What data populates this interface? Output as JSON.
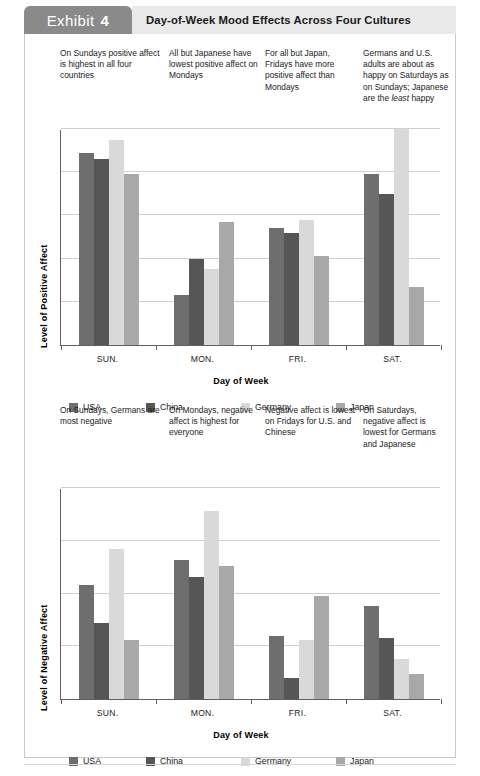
{
  "header": {
    "exhibit_word": "Exhibit",
    "exhibit_number": "4",
    "title": "Day-of-Week Mood Effects Across Four Cultures"
  },
  "palette": {
    "usa": "#6e6e6e",
    "china": "#565656",
    "germany": "#d9d9d9",
    "japan": "#a8a8a8",
    "tab_bg": "#8a8a8a",
    "title_bg": "#e9e9e9",
    "axis": "#5f5f5f",
    "gridline": "#cfcfcf",
    "frame": "#c9c9c9"
  },
  "chart_data": [
    {
      "id": "positive-affect",
      "type": "bar",
      "title": "",
      "xlabel": "Day of Week",
      "ylabel": "Level of Positive Affect",
      "categories": [
        "SUN.",
        "MON.",
        "FRI.",
        "SAT."
      ],
      "ylim": [
        0,
        100
      ],
      "gridlines": [
        20,
        40,
        60,
        80,
        100
      ],
      "grid": true,
      "legend_position": "bottom",
      "series": [
        {
          "name": "USA",
          "color": "#6e6e6e",
          "values": [
            89,
            23,
            54,
            79
          ]
        },
        {
          "name": "China",
          "color": "#565656",
          "values": [
            86,
            40,
            52,
            70
          ]
        },
        {
          "name": "Germany",
          "color": "#d9d9d9",
          "values": [
            95,
            35,
            58,
            100
          ]
        },
        {
          "name": "Japan",
          "color": "#a8a8a8",
          "values": [
            79,
            57,
            41,
            27
          ]
        }
      ],
      "annotations": [
        "On Sundays positive affect is highest in all four countries",
        "All but Japanese have lowest positive affect on Mondays",
        "For all but Japan, Fridays have more positive affect than Mondays",
        "Germans and U.S. adults are about as happy on Saturdays as on Sundays; Japanese are the least happy"
      ]
    },
    {
      "id": "negative-affect",
      "type": "bar",
      "title": "",
      "xlabel": "Day of Week",
      "ylabel": "Level of Negative Affect",
      "categories": [
        "SUN.",
        "MON.",
        "FRI.",
        "SAT."
      ],
      "ylim": [
        0,
        100
      ],
      "gridlines": [
        25,
        50,
        75,
        100
      ],
      "grid": true,
      "legend_position": "bottom",
      "series": [
        {
          "name": "USA",
          "color": "#6e6e6e",
          "values": [
            54,
            66,
            30,
            44
          ]
        },
        {
          "name": "China",
          "color": "#565656",
          "values": [
            36,
            58,
            10,
            29
          ]
        },
        {
          "name": "Germany",
          "color": "#d9d9d9",
          "values": [
            71,
            89,
            28,
            19
          ]
        },
        {
          "name": "Japan",
          "color": "#a8a8a8",
          "values": [
            28,
            63,
            49,
            12
          ]
        }
      ],
      "annotations": [
        "On Sundays, Germans are most negative",
        "On Mondays, negative affect is highest for everyone",
        "Negative affect is lowest on Fridays for U.S. and Chinese",
        "On Saturdays, negative affect is lowest for Germans and Japanese"
      ]
    }
  ]
}
